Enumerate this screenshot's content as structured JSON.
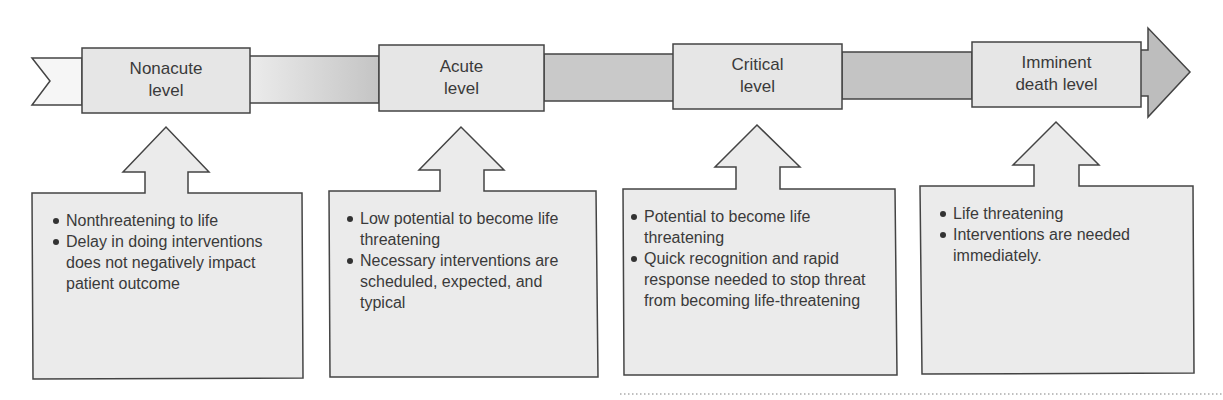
{
  "diagram": {
    "type": "acuity-continuum",
    "colors": {
      "level_box_fill": "#e6e6e6",
      "band_fill": "#cfcfcf",
      "arrow_head_fill": "#bdbdbd",
      "desc_box_fill": "#ebebeb",
      "stroke": "#444444"
    },
    "levels": [
      {
        "label": "Nonacute level",
        "label_lines": [
          "Nonacute",
          "level"
        ],
        "bullets": [
          "Nonthreatening to life",
          "Delay in doing interventions does not negatively impact patient outcome"
        ]
      },
      {
        "label": "Acute level",
        "label_lines": [
          "Acute",
          "level"
        ],
        "bullets": [
          "Low potential to become life threatening",
          "Necessary interventions are scheduled, expected, and typical"
        ]
      },
      {
        "label": "Critical level",
        "label_lines": [
          "Critical",
          "level"
        ],
        "bullets": [
          "Potential to become life threatening",
          "Quick recognition and rapid response needed to stop threat from becoming life-threatening"
        ]
      },
      {
        "label": "Imminent death level",
        "label_lines": [
          "Imminent",
          "death level"
        ],
        "bullets": [
          "Life threatening",
          "Interventions are needed immediately."
        ]
      }
    ]
  }
}
